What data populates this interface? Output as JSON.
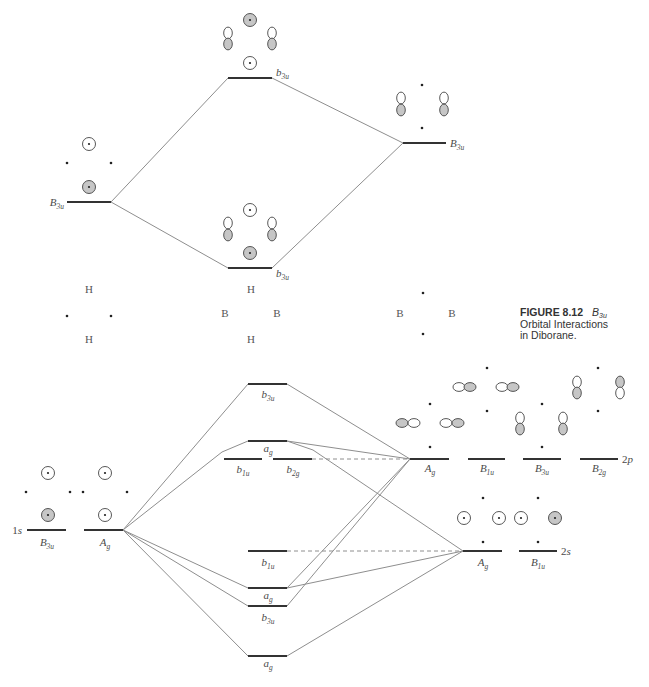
{
  "figure": {
    "caption": {
      "number": "FIGURE 8.12",
      "symmetry": {
        "main": "B",
        "sub": "3u"
      },
      "line2": "Orbital Interactions",
      "line3": "in Diborane."
    }
  },
  "style": {
    "level_color": "#333333",
    "connector_color": "#8e8e8e",
    "shaded_fill": "#c6c6c6",
    "label_color": "#4a4a4a"
  },
  "upper_diagram": {
    "connectors": [
      {
        "points": [
          [
            111,
            202
          ],
          [
            228,
            78
          ]
        ]
      },
      {
        "points": [
          [
            111,
            202
          ],
          [
            228,
            268
          ]
        ]
      },
      {
        "points": [
          [
            272,
            78
          ],
          [
            403,
            143
          ]
        ]
      },
      {
        "points": [
          [
            272,
            268
          ],
          [
            403,
            143
          ]
        ]
      }
    ],
    "levels": [
      {
        "x1": 67,
        "x2": 111,
        "y": 202,
        "label": {
          "main": "B",
          "sub": "3u"
        },
        "lx": 64,
        "ly": 206,
        "anchor": "end"
      },
      {
        "x1": 228,
        "x2": 272,
        "y": 78,
        "label": {
          "main": "b",
          "sub": "3u"
        },
        "lx": 276,
        "ly": 76,
        "anchor": "start"
      },
      {
        "x1": 228,
        "x2": 272,
        "y": 268,
        "label": {
          "main": "b",
          "sub": "3u"
        },
        "lx": 276,
        "ly": 277,
        "anchor": "start"
      },
      {
        "x1": 403,
        "x2": 446,
        "y": 143,
        "label": {
          "main": "B",
          "sub": "3u"
        },
        "lx": 450,
        "ly": 147,
        "anchor": "start"
      }
    ],
    "orbitals": [
      [
        "c",
        89,
        144,
        0
      ],
      [
        "d",
        67,
        163,
        0
      ],
      [
        "d",
        111,
        163,
        0
      ],
      [
        "c",
        89,
        187,
        1
      ],
      [
        "c",
        250,
        20,
        1
      ],
      [
        "v",
        228,
        33,
        0
      ],
      [
        "v",
        228,
        44,
        1
      ],
      [
        "v",
        272,
        33,
        0
      ],
      [
        "v",
        272,
        44,
        1
      ],
      [
        "c",
        250,
        63,
        0
      ],
      [
        "c",
        250,
        210,
        0
      ],
      [
        "v",
        228,
        223,
        0
      ],
      [
        "v",
        228,
        235,
        1
      ],
      [
        "v",
        272,
        223,
        0
      ],
      [
        "v",
        272,
        235,
        1
      ],
      [
        "c",
        250,
        253,
        1
      ],
      [
        "d",
        422,
        85,
        0
      ],
      [
        "d",
        422,
        128,
        0
      ],
      [
        "v",
        401,
        98,
        0
      ],
      [
        "v",
        401,
        110,
        1
      ],
      [
        "v",
        444,
        98,
        0
      ],
      [
        "v",
        444,
        110,
        1
      ],
      [
        "d",
        67,
        316,
        0
      ],
      [
        "d",
        111,
        316,
        0
      ],
      [
        "d",
        423,
        293,
        0
      ],
      [
        "d",
        423,
        334,
        0
      ]
    ],
    "atom_labels": [
      {
        "text": "H",
        "x": 89,
        "y": 293
      },
      {
        "text": "H",
        "x": 89,
        "y": 343
      },
      {
        "text": "H",
        "x": 251,
        "y": 293
      },
      {
        "text": "B",
        "x": 225,
        "y": 317
      },
      {
        "text": "B",
        "x": 277,
        "y": 317
      },
      {
        "text": "H",
        "x": 251,
        "y": 343
      },
      {
        "text": "B",
        "x": 400,
        "y": 317
      },
      {
        "text": "B",
        "x": 452,
        "y": 317
      }
    ]
  },
  "lower_diagram": {
    "connectors": [
      {
        "points": [
          [
            123,
            530
          ],
          [
            248,
            384
          ]
        ]
      },
      {
        "points": [
          [
            123,
            530
          ],
          [
            222,
            452
          ],
          [
            248,
            441
          ]
        ]
      },
      {
        "points": [
          [
            123,
            530
          ],
          [
            248,
            588
          ]
        ]
      },
      {
        "points": [
          [
            123,
            530
          ],
          [
            248,
            606
          ]
        ]
      },
      {
        "points": [
          [
            123,
            530
          ],
          [
            248,
            656
          ]
        ]
      },
      {
        "points": [
          [
            287,
            384
          ],
          [
            410,
            459
          ]
        ]
      },
      {
        "points": [
          [
            287,
            441
          ],
          [
            410,
            459
          ]
        ]
      },
      {
        "points": [
          [
            287,
            441
          ],
          [
            313,
            450
          ],
          [
            463,
            551
          ]
        ]
      },
      {
        "points": [
          [
            312,
            459
          ],
          [
            410,
            459
          ]
        ],
        "dashed": true
      },
      {
        "points": [
          [
            287,
            551
          ],
          [
            463,
            551
          ]
        ],
        "dashed": true
      },
      {
        "points": [
          [
            287,
            588
          ],
          [
            410,
            459
          ]
        ]
      },
      {
        "points": [
          [
            287,
            588
          ],
          [
            463,
            551
          ]
        ]
      },
      {
        "points": [
          [
            287,
            606
          ],
          [
            410,
            459
          ]
        ]
      },
      {
        "points": [
          [
            287,
            656
          ],
          [
            463,
            551
          ]
        ]
      }
    ],
    "levels": [
      {
        "x1": 27,
        "x2": 66,
        "y": 530,
        "label": {
          "main": "B",
          "sub": "3u"
        },
        "lx": 47,
        "ly": 546,
        "anchor": "middle"
      },
      {
        "x1": 84,
        "x2": 123,
        "y": 530,
        "label": {
          "main": "A",
          "sub": "g"
        },
        "lx": 105,
        "ly": 546,
        "anchor": "middle"
      },
      {
        "x1": 248,
        "x2": 287,
        "y": 384,
        "label": {
          "main": "b",
          "sub": "3u"
        },
        "lx": 268,
        "ly": 398,
        "anchor": "middle"
      },
      {
        "x1": 248,
        "x2": 287,
        "y": 441,
        "label": {
          "main": "a",
          "sub": "g"
        },
        "lx": 268,
        "ly": 452,
        "anchor": "middle"
      },
      {
        "x1": 224,
        "x2": 262,
        "y": 459,
        "label": {
          "main": "b",
          "sub": "1u"
        },
        "lx": 243,
        "ly": 473,
        "anchor": "middle"
      },
      {
        "x1": 273,
        "x2": 312,
        "y": 459,
        "label": {
          "main": "b",
          "sub": "2g"
        },
        "lx": 293,
        "ly": 473,
        "anchor": "middle"
      },
      {
        "x1": 248,
        "x2": 287,
        "y": 551,
        "label": {
          "main": "b",
          "sub": "1u"
        },
        "lx": 268,
        "ly": 566,
        "anchor": "middle"
      },
      {
        "x1": 248,
        "x2": 287,
        "y": 588,
        "label": {
          "main": "a",
          "sub": "g"
        },
        "lx": 268,
        "ly": 599,
        "anchor": "middle"
      },
      {
        "x1": 248,
        "x2": 287,
        "y": 606,
        "label": {
          "main": "b",
          "sub": "3u"
        },
        "lx": 268,
        "ly": 621,
        "anchor": "middle"
      },
      {
        "x1": 248,
        "x2": 287,
        "y": 656,
        "label": {
          "main": "a",
          "sub": "g"
        },
        "lx": 268,
        "ly": 667,
        "anchor": "middle"
      },
      {
        "x1": 410,
        "x2": 449,
        "y": 459,
        "label": {
          "main": "A",
          "sub": "g"
        },
        "lx": 430,
        "ly": 472,
        "anchor": "middle"
      },
      {
        "x1": 468,
        "x2": 505,
        "y": 459,
        "label": {
          "main": "B",
          "sub": "1u"
        },
        "lx": 487,
        "ly": 472,
        "anchor": "middle"
      },
      {
        "x1": 523,
        "x2": 561,
        "y": 459,
        "label": {
          "main": "B",
          "sub": "3u"
        },
        "lx": 542,
        "ly": 472,
        "anchor": "middle"
      },
      {
        "x1": 580,
        "x2": 618,
        "y": 459,
        "label": {
          "main": "B",
          "sub": "2g"
        },
        "lx": 599,
        "ly": 472,
        "anchor": "middle"
      },
      {
        "x1": 463,
        "x2": 502,
        "y": 551,
        "label": {
          "main": "A",
          "sub": "g"
        },
        "lx": 483,
        "ly": 566,
        "anchor": "middle"
      },
      {
        "x1": 519,
        "x2": 557,
        "y": 551,
        "label": {
          "main": "B",
          "sub": "1u"
        },
        "lx": 538,
        "ly": 566,
        "anchor": "middle"
      }
    ],
    "side_labels": [
      {
        "n": "1",
        "l": "s",
        "x": 22,
        "y": 534,
        "anchor": "end"
      },
      {
        "n": "2",
        "l": "p",
        "x": 622,
        "y": 463,
        "anchor": "start"
      },
      {
        "n": "2",
        "l": "s",
        "x": 561,
        "y": 555,
        "anchor": "start"
      }
    ],
    "orbitals": [
      [
        "c",
        48,
        473,
        0
      ],
      [
        "d",
        26,
        492,
        0
      ],
      [
        "d",
        70,
        492,
        0
      ],
      [
        "c",
        48,
        515,
        1
      ],
      [
        "c",
        105,
        473,
        0
      ],
      [
        "d",
        83,
        492,
        0
      ],
      [
        "d",
        127,
        492,
        0
      ],
      [
        "c",
        105,
        515,
        0
      ],
      [
        "d",
        430,
        404,
        0
      ],
      [
        "d",
        430,
        447,
        0
      ],
      [
        "h",
        402,
        423,
        1
      ],
      [
        "h",
        414,
        423,
        0
      ],
      [
        "h",
        446,
        423,
        0
      ],
      [
        "h",
        458,
        423,
        1
      ],
      [
        "d",
        487,
        368,
        0
      ],
      [
        "d",
        487,
        411,
        0
      ],
      [
        "h",
        459,
        387,
        0
      ],
      [
        "h",
        470,
        387,
        1
      ],
      [
        "h",
        502,
        387,
        0
      ],
      [
        "h",
        513,
        387,
        1
      ],
      [
        "d",
        542,
        404,
        0
      ],
      [
        "d",
        542,
        447,
        0
      ],
      [
        "v",
        520,
        418,
        0
      ],
      [
        "v",
        520,
        429,
        1
      ],
      [
        "v",
        563,
        418,
        0
      ],
      [
        "v",
        563,
        429,
        1
      ],
      [
        "d",
        598,
        368,
        0
      ],
      [
        "d",
        598,
        411,
        0
      ],
      [
        "v",
        577,
        382,
        0
      ],
      [
        "v",
        577,
        393,
        1
      ],
      [
        "v",
        620,
        382,
        1
      ],
      [
        "v",
        620,
        393,
        0
      ],
      [
        "d",
        483,
        498,
        0
      ],
      [
        "d",
        483,
        542,
        0
      ],
      [
        "d",
        538,
        498,
        0
      ],
      [
        "d",
        538,
        542,
        0
      ],
      [
        "c",
        464,
        518,
        0
      ],
      [
        "c",
        499,
        518,
        0
      ],
      [
        "c",
        521,
        518,
        0
      ],
      [
        "c",
        555,
        518,
        1
      ]
    ]
  }
}
